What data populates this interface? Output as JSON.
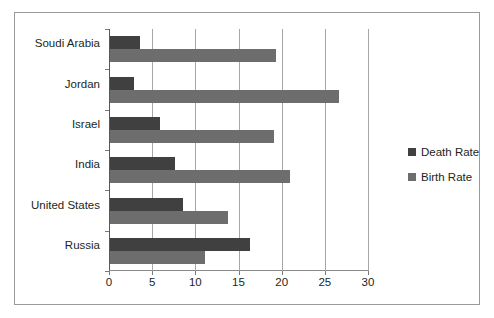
{
  "chart_data": {
    "type": "bar",
    "orientation": "horizontal",
    "title": "",
    "xlabel": "",
    "ylabel": "",
    "categories": [
      "Soudi Arabia",
      "Jordan",
      "Israel",
      "India",
      "United States",
      "Russia"
    ],
    "series": [
      {
        "name": "Death Rate",
        "color": "#404040",
        "values": [
          3.5,
          2.8,
          5.8,
          7.5,
          8.4,
          16.2
        ]
      },
      {
        "name": "Birth Rate",
        "color": "#6d6d6d",
        "values": [
          19.2,
          26.5,
          19.0,
          20.8,
          13.7,
          11.0
        ]
      }
    ],
    "xlim": [
      0,
      30
    ],
    "xticks": [
      0,
      5,
      10,
      15,
      20,
      25,
      30
    ],
    "xtick_labels": [
      "0",
      "5",
      "10",
      "15",
      "20",
      "25",
      "30"
    ],
    "grid": "vertical",
    "legend_position": "right"
  },
  "legend": {
    "items": [
      {
        "label": "Death Rate",
        "swatch": "death"
      },
      {
        "label": "Birth Rate",
        "swatch": "birth"
      }
    ]
  }
}
